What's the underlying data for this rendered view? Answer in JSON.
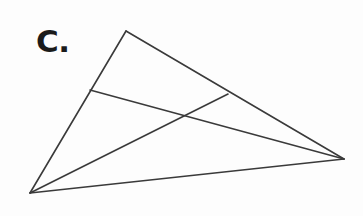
{
  "figure": {
    "label": "C.",
    "background_color": "#fdfdfd",
    "stroke_color": "#3a3a3a",
    "stroke_width": 1.6,
    "canvas": {
      "width": 363,
      "height": 216
    },
    "label_position": {
      "x": 36,
      "y": 26
    },
    "points": {
      "apex": {
        "name": "A",
        "x": 126,
        "y": 31
      },
      "bottom_left": {
        "name": "B",
        "x": 30,
        "y": 193
      },
      "right": {
        "name": "C",
        "x": 344,
        "y": 159
      },
      "left_side_point": {
        "name": "D",
        "x": 90,
        "y": 90
      },
      "right_side_point": {
        "name": "E",
        "x": 228,
        "y": 94
      },
      "intersection": {
        "name": "P",
        "x": 182,
        "y": 113
      }
    },
    "segments": [
      {
        "name": "side-apex-to-bottom-left",
        "d": "M 126 31 L 30 193"
      },
      {
        "name": "side-apex-to-right",
        "d": "M 126 31 L 344 159"
      },
      {
        "name": "side-bottom-left-to-right",
        "d": "M 30 193 L 344 159"
      },
      {
        "name": "cevian-left-point-to-right-vertex",
        "d": "M 90 90 L 344 159"
      },
      {
        "name": "cevian-bottom-left-to-right-point",
        "d": "M 30 193 L 228 94"
      }
    ]
  }
}
